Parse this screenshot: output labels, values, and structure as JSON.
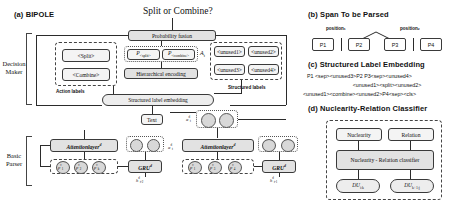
{
  "panels": {
    "a": {
      "label": "(a) BIPOLE",
      "title": "Split or Combine?"
    },
    "b": {
      "label": "(b) Span To be Parsed",
      "position_left": "position₁",
      "position_right": "position₂",
      "spans": [
        "P1",
        "P2",
        "P3",
        "P4"
      ]
    },
    "c": {
      "label": "(c) Structured Label Embedding",
      "lines": [
        "P1 <sep><unused3>P2 P3<sep><unused4>",
        "<unused1><split><unused2>",
        "<unused1><combine><unused2>P4<sep><cls>"
      ]
    },
    "d": {
      "label": "(d) Nuclearity-Relation Classifier",
      "nuclearity": "Nuclearity",
      "relation": "Relation",
      "classifier": "Nuclearity - Relation classifier",
      "du_left": "DU",
      "du_left_sub": "i:k",
      "du_right": "DU",
      "du_right_sub": "k+1:j"
    }
  },
  "decision_maker": {
    "side_label": "Decision Maker",
    "probability_fusion": "Probability fusion",
    "hierarchical_encoding": "Hierarchical encoding",
    "structured_label_embedding": "Structured label embedding",
    "action_labels_caption": "Action labels",
    "structured_labels_caption": "Structured labels",
    "actions": [
      "<Split>",
      "<Combine>"
    ],
    "probs": [
      {
        "sym": "P",
        "sub": "<split>"
      },
      {
        "sym": "P",
        "sub": "<combine>"
      }
    ],
    "action_var": "A",
    "action_var_sub": "t",
    "unused": [
      "<unused1>",
      "<unused2>",
      "<unused3>",
      "<unused4>"
    ]
  },
  "basic_parser": {
    "side_label": "Basic Parser",
    "text_box": "Text",
    "attention_left": "Attentionlayer",
    "attention_left_sup": "d",
    "attention_right": "Attentionlayer",
    "attention_right_sup": "d",
    "gru_left": "GRU",
    "gru_left_sup": "d",
    "gru_right": "GRU",
    "gru_right_sup": "d",
    "gru_left_state": "h",
    "gru_left_state_sub": "t-2",
    "gru_left_state_sup": "d",
    "gru_right_state": "h",
    "gru_right_state_sub": "t-1",
    "gru_right_state_sup": "d",
    "alpha_left": "α",
    "alpha_left_sup": "d",
    "alpha_left_sub": "t",
    "alpha_right": "α",
    "alpha_right_sup": "d",
    "alpha_right_sub": "t",
    "cells_left": [
      {
        "sym": "c",
        "sup": "d",
        "sub": "t"
      },
      {
        "sym": "h",
        "sup": "d",
        "sub": "t"
      }
    ],
    "cells_right": [
      {
        "sym": "c",
        "sup": "d",
        "sub": "t"
      },
      {
        "sym": "h",
        "sup": "d",
        "sub": "t"
      }
    ],
    "p_left": [
      {
        "sym": "p",
        "sup": "c",
        "sub": "1"
      },
      {
        "sym": "p",
        "sup": "c",
        "sub": "2"
      },
      {
        "sym": "p",
        "sup": "c",
        "sub": "k"
      }
    ],
    "p_right": [
      {
        "sym": "p",
        "sup": "c",
        "sub": "1"
      },
      {
        "sym": "p",
        "sup": "c",
        "sub": "3"
      },
      {
        "sym": "p",
        "sup": "c",
        "sub": "4"
      }
    ]
  }
}
